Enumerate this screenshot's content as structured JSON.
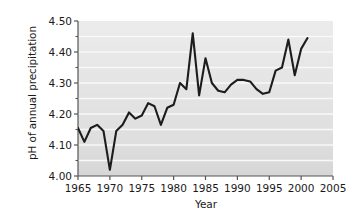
{
  "chart_data": {
    "type": "line",
    "title": "",
    "xlabel": "Year",
    "ylabel": "pH of annual precipitation",
    "xlim": [
      1965,
      2005
    ],
    "ylim": [
      4.0,
      4.5
    ],
    "xticks": [
      1965,
      1970,
      1975,
      1980,
      1985,
      1990,
      1995,
      2000,
      2005
    ],
    "xtick_labels": [
      "1965",
      "1970",
      "1975",
      "1980",
      "1985",
      "1990",
      "1995",
      "2000",
      "2005"
    ],
    "yticks": [
      4.0,
      4.1,
      4.2,
      4.3,
      4.4,
      4.5
    ],
    "ytick_labels": [
      "4.00",
      "4.10",
      "4.20",
      "4.30",
      "4.40",
      "4.50"
    ],
    "y_minor_ticks": [
      4.05,
      4.15,
      4.25,
      4.35,
      4.45
    ],
    "grid": "horizontal-white-gridlines-on-gray-background",
    "legend": "none",
    "line_color": "#1c1c1c",
    "line_width": 2.1,
    "plot_background": "#e3e3e3",
    "gridline_color": "#fafafa",
    "x": [
      1965,
      1966,
      1967,
      1968,
      1969,
      1970,
      1971,
      1972,
      1973,
      1974,
      1975,
      1976,
      1977,
      1978,
      1979,
      1980,
      1981,
      1982,
      1983,
      1984,
      1985,
      1986,
      1987,
      1988,
      1989,
      1990,
      1991,
      1992,
      1993,
      1994,
      1995,
      1996,
      1997,
      1998,
      1999,
      2000,
      2001
    ],
    "values": [
      4.155,
      4.11,
      4.155,
      4.165,
      4.145,
      4.02,
      4.145,
      4.165,
      4.205,
      4.185,
      4.195,
      4.235,
      4.225,
      4.165,
      4.22,
      4.23,
      4.3,
      4.28,
      4.46,
      4.26,
      4.38,
      4.3,
      4.275,
      4.27,
      4.295,
      4.31,
      4.31,
      4.305,
      4.28,
      4.265,
      4.27,
      4.34,
      4.35,
      4.44,
      4.325,
      4.41,
      4.445
    ],
    "series": [
      {
        "name": "pH of annual precipitation",
        "values": [
          4.155,
          4.11,
          4.155,
          4.165,
          4.145,
          4.02,
          4.145,
          4.165,
          4.205,
          4.185,
          4.195,
          4.235,
          4.225,
          4.165,
          4.22,
          4.23,
          4.3,
          4.28,
          4.46,
          4.26,
          4.38,
          4.3,
          4.275,
          4.27,
          4.295,
          4.31,
          4.31,
          4.305,
          4.28,
          4.265,
          4.27,
          4.34,
          4.35,
          4.44,
          4.325,
          4.41,
          4.445
        ]
      }
    ]
  }
}
